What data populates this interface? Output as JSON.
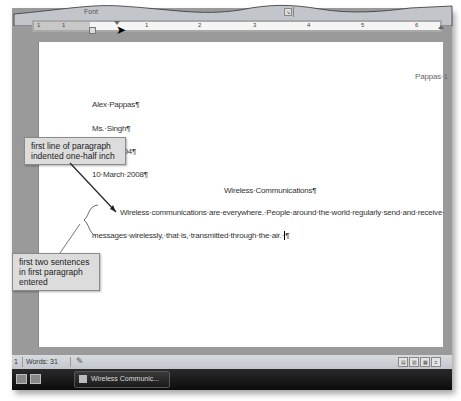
{
  "ribbon": {
    "group_label": "Font",
    "dialog_launcher_glyph": "↘"
  },
  "ruler": {
    "left_numbers": [
      "1",
      "1"
    ],
    "numbers": [
      "1",
      "2",
      "3",
      "4",
      "5",
      "6"
    ],
    "first_line_indent_marker": "first-line-indent",
    "hanging_indent_marker": "hanging-indent"
  },
  "document": {
    "header": "Pappas·1",
    "lines": {
      "name": "Alex·Pappas¶",
      "instructor": "Ms.·Singh¶",
      "course": "English·104¶",
      "date": "10·March·2008¶",
      "title": "Wireless·Communications¶",
      "para1_line1": "Wireless·communications·are·everywhere.·People·around·the·world·regularly·send·and·receive·",
      "para1_line2": "messages·wirelessly,·that·is,·transmitted·through·the·air.·",
      "para_mark": "¶"
    }
  },
  "callouts": {
    "indent": "first line of paragraph indented one-half inch",
    "sentences": "first two sentences in first paragraph entered"
  },
  "statusbar": {
    "page": "1",
    "words": "Words: 31",
    "proofing_icon": "proofing-icon",
    "views": [
      "print-layout",
      "full-screen-reading",
      "web-layout",
      "outline",
      "draft"
    ]
  },
  "taskbar": {
    "task_label": "Wireless Communic..."
  }
}
